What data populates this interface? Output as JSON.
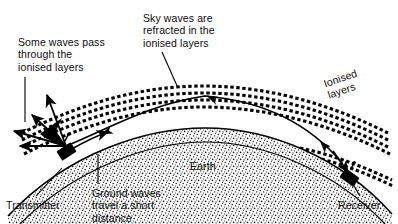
{
  "diagram": {
    "colors": {
      "ink": "#000000",
      "background": "#ffffff",
      "earth_fill": "#ffffff",
      "earth_stipple": "#1a1a1a",
      "layer_dash": "#000000"
    },
    "labels": {
      "some_waves": "Some waves pass\nthrough the\nionised layers",
      "sky_waves": "Sky waves are\nrefracted in the\nionised layers",
      "ionised_layers": "Ionised\nlayers",
      "earth": "Earth",
      "ground_waves": "Ground waves\ntravel a short\ndistance",
      "transmitter": "Transmitter",
      "receiver": "Receiver"
    },
    "elements": [
      {
        "name": "earth-arc",
        "kind": "stippled-band",
        "description": "Curved earth surface band drawn as an arc with dotted stipple fill"
      },
      {
        "name": "ionised-layers",
        "kind": "dashed-bands",
        "count": 5,
        "description": "Five concentric arcs of short horizontal dashes representing ionised layers"
      },
      {
        "name": "sky-wave-path",
        "kind": "curve-with-arrows",
        "arrowheads": 3,
        "description": "Solid arc from transmitter, refracted through the layers, down to the receiver"
      },
      {
        "name": "ground-wave-arrow",
        "kind": "short-arrow",
        "description": "Short arrow hugging the earth surface near the transmitter"
      },
      {
        "name": "escaping-rays",
        "kind": "arrow-cluster",
        "count": 4,
        "description": "Arrows from the transmitter passing straight out through the ionised layers"
      },
      {
        "name": "transmitter-icon",
        "kind": "antenna-box",
        "description": "Small black box with mast on the earth at the left"
      },
      {
        "name": "receiver-icon",
        "kind": "antenna-box",
        "description": "Small black box with mast on the earth at the right"
      }
    ]
  }
}
